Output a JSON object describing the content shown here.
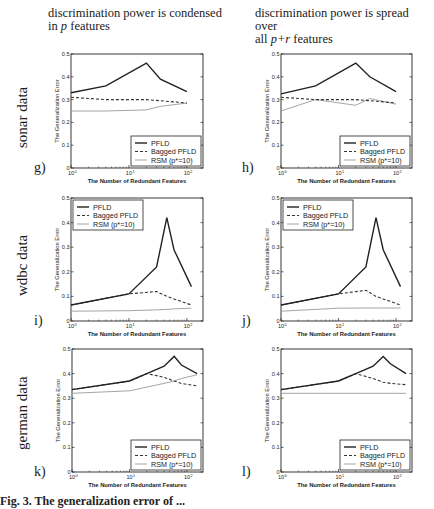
{
  "columns": [
    {
      "line1": "discrimination power is condensed",
      "line2_pre": "in ",
      "line2_em": "p",
      "line2_post": " features"
    },
    {
      "line1": "discrimination power is spread over",
      "line2_pre": "all ",
      "line2_em": "p+r",
      "line2_post": " features"
    }
  ],
  "rows": [
    {
      "label": "sonar data"
    },
    {
      "label": "wdbc data"
    },
    {
      "label": "german data"
    }
  ],
  "panels": [
    "g)",
    "h)",
    "i)",
    "j)",
    "k)",
    "l)"
  ],
  "caption": "Fig. 3. The generalization error of ...",
  "chart_data": [
    {
      "id": "g",
      "type": "line",
      "dataset": "sonar",
      "condition": "condensed",
      "xlabel": "The Number of Redundant Features",
      "ylabel": "The Generalization Error",
      "xscale": "log",
      "xlim": [
        1,
        190
      ],
      "ylim": [
        0,
        0.5
      ],
      "xticks": [
        "10^0",
        "10^1",
        "10^2"
      ],
      "yticks": [
        0,
        0.1,
        0.2,
        0.3,
        0.4,
        0.5
      ],
      "legend_position": "lower right",
      "x": [
        1,
        4,
        20,
        35,
        100
      ],
      "series": [
        {
          "name": "PFLD",
          "style": "solid",
          "values": [
            0.33,
            0.36,
            0.46,
            0.39,
            0.335
          ]
        },
        {
          "name": "Bagged PFLD",
          "style": "dashed",
          "values": [
            0.31,
            0.3,
            0.3,
            0.295,
            0.285
          ]
        },
        {
          "name": "RSM (p*=10)",
          "style": "dotted",
          "values": [
            0.25,
            0.25,
            0.255,
            0.27,
            0.285
          ]
        }
      ]
    },
    {
      "id": "h",
      "type": "line",
      "dataset": "sonar",
      "condition": "spread",
      "xlabel": "The Number of Redundant Features",
      "ylabel": "The Generalization Error",
      "xscale": "log",
      "xlim": [
        1,
        190
      ],
      "ylim": [
        0,
        0.5
      ],
      "xticks": [
        "10^0",
        "10^1",
        "10^2"
      ],
      "yticks": [
        0,
        0.1,
        0.2,
        0.3,
        0.4,
        0.5
      ],
      "legend_position": "lower right",
      "x": [
        1,
        4,
        20,
        35,
        100
      ],
      "series": [
        {
          "name": "PFLD",
          "style": "solid",
          "values": [
            0.325,
            0.36,
            0.46,
            0.4,
            0.335
          ]
        },
        {
          "name": "Bagged PFLD",
          "style": "dashed",
          "values": [
            0.31,
            0.3,
            0.3,
            0.295,
            0.285
          ]
        },
        {
          "name": "RSM (p*=10)",
          "style": "dotted",
          "values": [
            0.25,
            0.3,
            0.275,
            0.305,
            0.28
          ]
        }
      ]
    },
    {
      "id": "i",
      "type": "line",
      "dataset": "wdbc",
      "condition": "condensed",
      "xlabel": "The Number of Redundant Features",
      "ylabel": "The Generalization Error",
      "xscale": "log",
      "xlim": [
        1,
        190
      ],
      "ylim": [
        0,
        0.5
      ],
      "xticks": [
        "10^0",
        "10^1",
        "10^2"
      ],
      "yticks": [
        0,
        0.1,
        0.2,
        0.3,
        0.4,
        0.5
      ],
      "legend_position": "upper left",
      "x": [
        1,
        10,
        30,
        45,
        60,
        120
      ],
      "series": [
        {
          "name": "PFLD",
          "style": "solid",
          "values": [
            0.065,
            0.11,
            0.22,
            0.42,
            0.29,
            0.14
          ]
        },
        {
          "name": "Bagged PFLD",
          "style": "dashed",
          "values": [
            0.065,
            0.11,
            0.12,
            0.1,
            0.09,
            0.065
          ]
        },
        {
          "name": "RSM (p*=10)",
          "style": "dotted",
          "values": [
            0.04,
            0.042,
            0.045,
            0.047,
            0.049,
            0.052
          ]
        }
      ]
    },
    {
      "id": "j",
      "type": "line",
      "dataset": "wdbc",
      "condition": "spread",
      "xlabel": "The Number of Redundant Features",
      "ylabel": "The Generalization Error",
      "xscale": "log",
      "xlim": [
        1,
        190
      ],
      "ylim": [
        0,
        0.5
      ],
      "xticks": [
        "10^0",
        "10^1",
        "10^2"
      ],
      "yticks": [
        0,
        0.1,
        0.2,
        0.3,
        0.4,
        0.5
      ],
      "legend_position": "upper left",
      "x": [
        1,
        10,
        30,
        45,
        60,
        120
      ],
      "series": [
        {
          "name": "PFLD",
          "style": "solid",
          "values": [
            0.065,
            0.11,
            0.22,
            0.42,
            0.29,
            0.14
          ]
        },
        {
          "name": "Bagged PFLD",
          "style": "dashed",
          "values": [
            0.065,
            0.11,
            0.125,
            0.1,
            0.09,
            0.065
          ]
        },
        {
          "name": "RSM (p*=10)",
          "style": "dotted",
          "values": [
            0.04,
            0.052,
            0.053,
            0.053,
            0.053,
            0.053
          ]
        }
      ]
    },
    {
      "id": "k",
      "type": "line",
      "dataset": "german",
      "condition": "condensed",
      "xlabel": "The Number of Redundant Features",
      "ylabel": "The Generalization Error",
      "xscale": "log",
      "xlim": [
        1,
        190
      ],
      "ylim": [
        0,
        0.5
      ],
      "xticks": [
        "10^0",
        "10^1",
        "10^2"
      ],
      "yticks": [
        0,
        0.1,
        0.2,
        0.3,
        0.4,
        0.5
      ],
      "legend_position": "lower right",
      "x": [
        1,
        10,
        20,
        40,
        60,
        80,
        150
      ],
      "series": [
        {
          "name": "PFLD",
          "style": "solid",
          "values": [
            0.335,
            0.37,
            0.4,
            0.43,
            0.47,
            0.435,
            0.4
          ]
        },
        {
          "name": "Bagged PFLD",
          "style": "dashed",
          "values": [
            0.335,
            0.37,
            0.4,
            0.385,
            0.37,
            0.36,
            0.35
          ]
        },
        {
          "name": "RSM (p*=10)",
          "style": "dotted",
          "values": [
            0.32,
            0.33,
            0.345,
            0.36,
            0.37,
            0.38,
            0.395
          ]
        }
      ]
    },
    {
      "id": "l",
      "type": "line",
      "dataset": "german",
      "condition": "spread",
      "xlabel": "The Number of Redundant Features",
      "ylabel": "The Generalization Error",
      "xscale": "log",
      "xlim": [
        1,
        190
      ],
      "ylim": [
        0,
        0.5
      ],
      "xticks": [
        "10^0",
        "10^1",
        "10^2"
      ],
      "yticks": [
        0,
        0.1,
        0.2,
        0.3,
        0.4,
        0.5
      ],
      "legend_position": "lower right",
      "x": [
        1,
        10,
        20,
        40,
        60,
        80,
        150
      ],
      "series": [
        {
          "name": "PFLD",
          "style": "solid",
          "values": [
            0.335,
            0.37,
            0.4,
            0.43,
            0.47,
            0.44,
            0.4
          ]
        },
        {
          "name": "Bagged PFLD",
          "style": "dashed",
          "values": [
            0.335,
            0.37,
            0.4,
            0.38,
            0.365,
            0.36,
            0.355
          ]
        },
        {
          "name": "RSM (p*=10)",
          "style": "dotted",
          "values": [
            0.32,
            0.32,
            0.32,
            0.32,
            0.32,
            0.32,
            0.32
          ]
        }
      ]
    }
  ]
}
